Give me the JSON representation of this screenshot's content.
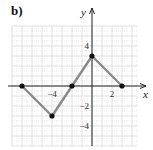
{
  "part_label": "b)",
  "chart_data": {
    "type": "line",
    "title": "",
    "xlabel": "x",
    "ylabel": "y",
    "x": [
      -7,
      -4,
      -2,
      0,
      3
    ],
    "y": [
      0,
      -3,
      0,
      3,
      0
    ],
    "series": [
      {
        "name": "piecewise linear graph",
        "points": [
          [
            -7,
            0
          ],
          [
            -4,
            -3
          ],
          [
            -2,
            0
          ],
          [
            0,
            3
          ],
          [
            3,
            0
          ]
        ]
      }
    ],
    "x_tick_labels": [
      {
        "value": -4,
        "label": "−4"
      },
      {
        "value": 2,
        "label": "2"
      }
    ],
    "y_tick_labels": [
      {
        "value": 4,
        "label": "4"
      },
      {
        "value": -2,
        "label": "−2"
      },
      {
        "value": -4,
        "label": "−4"
      }
    ],
    "xlim": [
      -8,
      4.5
    ],
    "ylim": [
      -6,
      6
    ],
    "grid": true,
    "legend": null
  },
  "colors": {
    "line": "#8a8a8a",
    "point": "#111111",
    "axis": "#222222",
    "grid": "#d9d9d9"
  }
}
